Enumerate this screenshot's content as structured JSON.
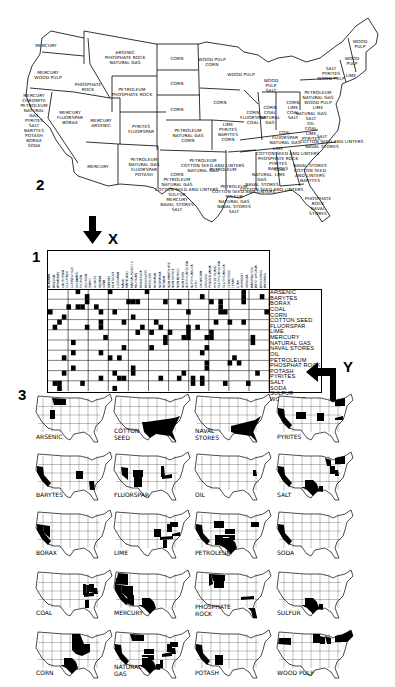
{
  "figure_numbers": {
    "fig2": "2",
    "fig1": "1",
    "fig3": "3"
  },
  "arrows": {
    "x_label": "X",
    "y_label": "Y"
  },
  "map": {
    "states": [
      {
        "id": "WA",
        "lines": [
          "MERCURY"
        ],
        "x": 46,
        "y": 43
      },
      {
        "id": "OR",
        "lines": [
          "MERCURY",
          "WOOD PULP"
        ],
        "x": 48,
        "y": 70
      },
      {
        "id": "CA",
        "lines": [
          "MERCURY",
          "CHROMITE",
          "PETROLEUM",
          "NATURAL",
          "GAS",
          "PYRITES",
          "SALT",
          "BARYTES",
          "POTASH",
          "BORAX",
          "SODA"
        ],
        "x": 34,
        "y": 93
      },
      {
        "id": "ID",
        "lines": [
          "PHOSPHATE",
          "ROCK"
        ],
        "x": 88,
        "y": 82
      },
      {
        "id": "NV",
        "lines": [
          "MERCURY",
          "FLUORSPAR",
          "BORAX"
        ],
        "x": 70,
        "y": 110
      },
      {
        "id": "MT",
        "lines": [
          "ARSENIC",
          "PHOSPHATE ROCK",
          "NATURAL GAS"
        ],
        "x": 125,
        "y": 50
      },
      {
        "id": "WY",
        "lines": [
          "PETROLEUM",
          "PHOSPHATE ROCK"
        ],
        "x": 132,
        "y": 87
      },
      {
        "id": "UT",
        "lines": [
          "MERCURY",
          "ARSENIC"
        ],
        "x": 101,
        "y": 118
      },
      {
        "id": "CO",
        "lines": [
          "PYRITES",
          "FLUORSPAR"
        ],
        "x": 141,
        "y": 124
      },
      {
        "id": "AZ",
        "lines": [
          "MERCURY"
        ],
        "x": 98,
        "y": 164
      },
      {
        "id": "NM",
        "lines": [
          "PETROLEUM",
          "NATURAL GAS",
          "FLUORSPAR",
          "POTASH"
        ],
        "x": 144,
        "y": 157
      },
      {
        "id": "ND",
        "lines": [
          "CORN"
        ],
        "x": 177,
        "y": 56
      },
      {
        "id": "SD",
        "lines": [
          "CORN"
        ],
        "x": 177,
        "y": 81
      },
      {
        "id": "NE",
        "lines": [
          "CORN"
        ],
        "x": 177,
        "y": 107
      },
      {
        "id": "KS",
        "lines": [
          "PETROLEUM",
          "NATURAL GAS",
          "CORN"
        ],
        "x": 188,
        "y": 128
      },
      {
        "id": "OK",
        "lines": [
          "PETROLEUM",
          "COTTON SEED AND LINTERS",
          "NATURAL GAS"
        ],
        "x": 203,
        "y": 158
      },
      {
        "id": "TX",
        "lines": [
          "CORN",
          "PETROLEUM",
          "NATURAL GAS",
          "COTTON SEED AND LINTERS",
          "SULFUR",
          "MERCURY",
          "NAVAL STORES",
          "SALT"
        ],
        "x": 177,
        "y": 172
      },
      {
        "id": "MN",
        "lines": [
          "WOOD PULP",
          "CORN"
        ],
        "x": 212,
        "y": 57
      },
      {
        "id": "WI",
        "lines": [
          "WOOD PULP"
        ],
        "x": 241,
        "y": 72
      },
      {
        "id": "IA",
        "lines": [
          "CORN"
        ],
        "x": 220,
        "y": 100
      },
      {
        "id": "MO",
        "lines": [
          "LIME",
          "PYRITES",
          "BARYTES",
          "CORN"
        ],
        "x": 228,
        "y": 122
      },
      {
        "id": "AR",
        "lines": [
          "PETROLEUM"
        ],
        "x": 223,
        "y": 167
      },
      {
        "id": "LA",
        "lines": [
          "PETROLEUM",
          "COTTON SEED AND LINTERS",
          "SULFUR",
          "NATURAL GAS",
          "NAVAL STORES",
          "SALT"
        ],
        "x": 234,
        "y": 184
      },
      {
        "id": "IL",
        "lines": [
          "CORN",
          "FLUORSPAR",
          "COAL"
        ],
        "x": 253,
        "y": 110
      },
      {
        "id": "MI",
        "lines": [
          "WOOD",
          "PULP",
          "SALT"
        ],
        "x": 271,
        "y": 78
      },
      {
        "id": "IN",
        "lines": [
          "CORN",
          "COAL",
          "NATURAL",
          "GAS"
        ],
        "x": 270,
        "y": 105
      },
      {
        "id": "OH",
        "lines": [
          "CORN",
          "LIME",
          "COAL",
          "SALT"
        ],
        "x": 293,
        "y": 100
      },
      {
        "id": "KY",
        "lines": [
          "COAL",
          "FLUORSPAR",
          "NATURAL GAS"
        ],
        "x": 285,
        "y": 130
      },
      {
        "id": "TN",
        "lines": [
          "LIME",
          "COTTON SEED AND LINTERS",
          "PHOSPHATE ROCK",
          "PYRITES",
          "BARYTES"
        ],
        "x": 278,
        "y": 146
      },
      {
        "id": "MS",
        "lines": [
          "NATURAL",
          "GAS",
          "NAVAL STORES",
          "COTTON SEED AND LINTERS"
        ],
        "x": 262,
        "y": 172
      },
      {
        "id": "AL",
        "lines": [
          "COAL",
          "LIME"
        ],
        "x": 280,
        "y": 167
      },
      {
        "id": "GA",
        "lines": [
          "NAVAL STORES",
          "COTTON SEED",
          "AND LINTERS",
          "BARYTES"
        ],
        "x": 310,
        "y": 163
      },
      {
        "id": "FL",
        "lines": [
          "PHOSPHATE",
          "ROCK",
          "NAVAL",
          "STORES"
        ],
        "x": 318,
        "y": 196
      },
      {
        "id": "WV",
        "lines": [
          "NATURAL GAS",
          "SALT",
          "OIL",
          "COAL",
          "LIME",
          "PYRITES"
        ],
        "x": 311,
        "y": 111
      },
      {
        "id": "PA",
        "lines": [
          "PETROLEUM",
          "NATURAL GAS",
          "WOOD PULP",
          "LIME"
        ],
        "x": 318,
        "y": 90
      },
      {
        "id": "NY",
        "lines": [
          "SALT",
          "PYRITES",
          "WOOD PULP"
        ],
        "x": 331,
        "y": 66
      },
      {
        "id": "VA",
        "lines": [
          "SALT",
          "COTTON SEED AND LINTERS",
          "NAVAL STORES"
        ],
        "x": 322,
        "y": 134
      },
      {
        "id": "VT",
        "lines": [
          "WOOD",
          "PULP"
        ],
        "x": 352,
        "y": 56
      },
      {
        "id": "ME",
        "lines": [
          "WOOD",
          "PULP"
        ],
        "x": 360,
        "y": 39
      },
      {
        "id": "NH",
        "lines": [
          "LIME"
        ],
        "x": 351,
        "y": 73
      }
    ]
  },
  "matrix": {
    "row_labels": [
      "ARSENIC",
      "BARYTES",
      "BORAX",
      "COAL",
      "CORN",
      "COTTON SEED",
      "FLUORSPAR",
      "LIME",
      "MERCURY",
      "NATURAL GAS",
      "NAVAL STORES",
      "OIL",
      "PETROLEUM",
      "PHOSPHAT ROCK",
      "POTASH",
      "PYRITES",
      "SALT",
      "SODA",
      "SULFUR",
      "WOOD PULP"
    ],
    "column_headers": [
      "ALABAMA",
      "ARIZONA",
      "ARKANSAS",
      "CALIFORNIA",
      "COLORADO",
      "CONNECTICUT",
      "DELAWARE",
      "FLORIDA",
      "GEORGIA",
      "IDAHO",
      "ILLINOIS",
      "INDIANA",
      "IOWA",
      "KANSAS",
      "KENTUCKY",
      "LOUISIANA",
      "MAINE",
      "MARYLAND",
      "MASSACHUSETTS",
      "MICHIGAN",
      "MINNESOTA",
      "MISSISSIPPI",
      "MISSOURI",
      "MONTANA",
      "NEBRASKA",
      "NEVADA",
      "NEW HAMPSHIRE",
      "NEW JERSEY",
      "NEW MEXICO",
      "NEW YORK",
      "NORTH CAROLINA",
      "NORTH DAKOTA",
      "OHIO",
      "OKLAHOMA",
      "OREGON",
      "PENNSYLVANIA",
      "RHODE ISLAND",
      "SOUTH CAROLINA",
      "SOUTH DAKOTA",
      "TENNESSEE",
      "TEXAS",
      "UTAH",
      "VERMONT",
      "VIRGINIA",
      "WASHINGTON",
      "WEST VIRGINIA",
      "WISCONSIN",
      "WYOMING"
    ]
  },
  "small_maps": [
    {
      "label": [
        "ARSENIC"
      ],
      "regions": [
        "MT",
        "UT"
      ]
    },
    {
      "label": [
        "COTTON",
        "SEED"
      ],
      "regions": [
        "SOUTH"
      ]
    },
    {
      "label": [
        "NAVAL",
        "STORES"
      ],
      "regions": [
        "SOUTHEAST"
      ]
    },
    {
      "label": [
        "PYRITES"
      ],
      "regions": [
        "CA",
        "CO",
        "MO",
        "VA",
        "NY"
      ]
    },
    {
      "label": [
        "BARYTES"
      ],
      "regions": [
        "CA",
        "MO",
        "GA"
      ]
    },
    {
      "label": [
        "FLUORSPAR"
      ],
      "regions": [
        "NV",
        "CO",
        "NM",
        "IL",
        "KY"
      ]
    },
    {
      "label": [
        "OIL"
      ],
      "regions": [
        "WV"
      ]
    },
    {
      "label": [
        "SALT"
      ],
      "regions": [
        "CA",
        "TX",
        "LA",
        "MI",
        "OH",
        "NY",
        "WV"
      ]
    },
    {
      "label": [
        "BORAX"
      ],
      "regions": [
        "CA",
        "NV"
      ]
    },
    {
      "label": [
        "LIME"
      ],
      "regions": [
        "MO",
        "TN",
        "AL",
        "OH",
        "PA",
        "VA"
      ]
    },
    {
      "label": [
        "PETROLEUM"
      ],
      "regions": [
        "CA",
        "WY",
        "TX",
        "OK",
        "KS",
        "NM",
        "PA"
      ]
    },
    {
      "label": [
        "SODA"
      ],
      "regions": [
        "CA"
      ]
    },
    {
      "label": [
        "COAL"
      ],
      "regions": [
        "IL",
        "IN",
        "OH",
        "KY",
        "AL",
        "WV"
      ]
    },
    {
      "label": [
        "MERCURY"
      ],
      "regions": [
        "WA",
        "OR",
        "CA",
        "NV",
        "UT",
        "AZ",
        "TX"
      ]
    },
    {
      "label": [
        "PHOSPHATE",
        "ROCK"
      ],
      "regions": [
        "MT",
        "ID",
        "WY",
        "TN",
        "FL"
      ]
    },
    {
      "label": [
        "SULFUR"
      ],
      "regions": [
        "TX",
        "LA"
      ]
    },
    {
      "label": [
        "CORN"
      ],
      "regions": [
        "MIDWEST",
        "TX"
      ]
    },
    {
      "label": [
        "NATURAL",
        "GAS"
      ],
      "regions": [
        "CA",
        "MT",
        "KS",
        "OK",
        "TX",
        "LA",
        "MS",
        "KY",
        "WV",
        "PA",
        "OH"
      ]
    },
    {
      "label": [
        "POTASH"
      ],
      "regions": [
        "CA",
        "NM"
      ]
    },
    {
      "label": [
        "WOOD PULP"
      ],
      "regions": [
        "OR",
        "MN",
        "WI",
        "MI",
        "NY",
        "NE_STATES"
      ]
    }
  ]
}
